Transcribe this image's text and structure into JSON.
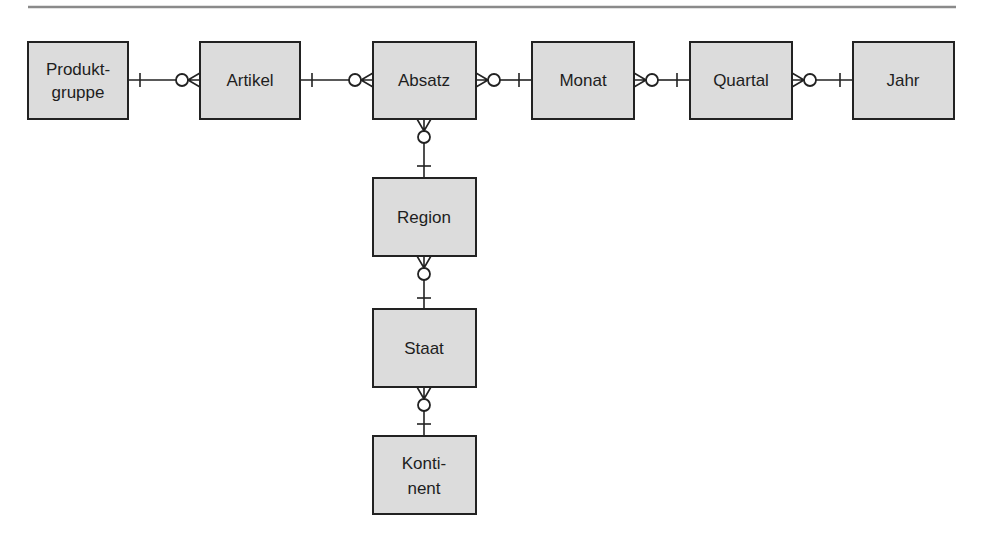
{
  "diagram": {
    "type": "entity-relationship (crow's foot notation)",
    "colors": {
      "entity_fill": "#dcdcdc",
      "stroke": "#222222",
      "rule": "#8a8a8a"
    },
    "entities": [
      {
        "id": "produktgruppe",
        "lines": [
          "Produkt-",
          "gruppe"
        ],
        "x": 28,
        "y": 42,
        "w": 100,
        "h": 77
      },
      {
        "id": "artikel",
        "lines": [
          "Artikel"
        ],
        "x": 200,
        "y": 42,
        "w": 100,
        "h": 77
      },
      {
        "id": "absatz",
        "lines": [
          "Absatz"
        ],
        "x": 373,
        "y": 42,
        "w": 103,
        "h": 77
      },
      {
        "id": "monat",
        "lines": [
          "Monat"
        ],
        "x": 532,
        "y": 42,
        "w": 102,
        "h": 77
      },
      {
        "id": "quartal",
        "lines": [
          "Quartal"
        ],
        "x": 690,
        "y": 42,
        "w": 102,
        "h": 77
      },
      {
        "id": "jahr",
        "lines": [
          "Jahr"
        ],
        "x": 853,
        "y": 42,
        "w": 101,
        "h": 77
      },
      {
        "id": "region",
        "lines": [
          "Region"
        ],
        "x": 373,
        "y": 178,
        "w": 103,
        "h": 78
      },
      {
        "id": "staat",
        "lines": [
          "Staat"
        ],
        "x": 373,
        "y": 309,
        "w": 103,
        "h": 78
      },
      {
        "id": "kontinent",
        "lines": [
          "Konti-",
          "nent"
        ],
        "x": 373,
        "y": 436,
        "w": 103,
        "h": 78
      }
    ],
    "relationships": [
      {
        "one": "produktgruppe",
        "many": "artikel",
        "one_end": "exactly-one",
        "many_end": "zero-or-many"
      },
      {
        "one": "artikel",
        "many": "absatz",
        "one_end": "exactly-one",
        "many_end": "zero-or-many"
      },
      {
        "one": "monat",
        "many": "absatz",
        "one_end": "exactly-one",
        "many_end": "zero-or-many"
      },
      {
        "one": "quartal",
        "many": "monat",
        "one_end": "exactly-one",
        "many_end": "zero-or-many"
      },
      {
        "one": "jahr",
        "many": "quartal",
        "one_end": "exactly-one",
        "many_end": "zero-or-many"
      },
      {
        "one": "region",
        "many": "absatz",
        "one_end": "exactly-one",
        "many_end": "zero-or-many"
      },
      {
        "one": "staat",
        "many": "region",
        "one_end": "exactly-one",
        "many_end": "zero-or-many"
      },
      {
        "one": "kontinent",
        "many": "staat",
        "one_end": "exactly-one",
        "many_end": "zero-or-many"
      }
    ]
  },
  "labels": {
    "produktgruppe_1": "Produkt-",
    "produktgruppe_2": "gruppe",
    "artikel": "Artikel",
    "absatz": "Absatz",
    "monat": "Monat",
    "quartal": "Quartal",
    "jahr": "Jahr",
    "region": "Region",
    "staat": "Staat",
    "kontinent_1": "Konti-",
    "kontinent_2": "nent"
  }
}
